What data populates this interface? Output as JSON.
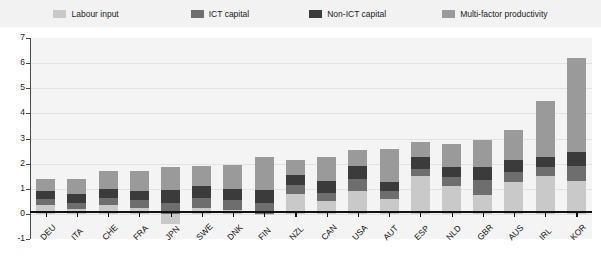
{
  "legend": {
    "items": [
      {
        "label": "Labour input",
        "color": "#c9c9c9",
        "name": "legend-labour-input"
      },
      {
        "label": "ICT capital",
        "color": "#6e6e6e",
        "name": "legend-ict-capital"
      },
      {
        "label": "Non-ICT capital",
        "color": "#3b3b3b",
        "name": "legend-non-ict-capital"
      },
      {
        "label": "Multi-factor productivity",
        "color": "#9a9a9a",
        "name": "legend-multi-factor-productivity"
      }
    ]
  },
  "axis": {
    "y_ticks": [
      "7",
      "6",
      "5",
      "4",
      "3",
      "2",
      "1",
      "0",
      "-1"
    ],
    "y_min": -1,
    "y_max": 7
  },
  "chart_data": {
    "type": "bar",
    "stacked": true,
    "title": "",
    "xlabel": "",
    "ylabel": "",
    "ylim": [
      -1,
      7
    ],
    "grid": true,
    "legend_position": "top",
    "categories": [
      "DEU",
      "ITA",
      "CHE",
      "FRA",
      "JPN",
      "SWE",
      "DNK",
      "FIN",
      "NZL",
      "CAN",
      "USA",
      "AUT",
      "ESP",
      "NLD",
      "GBR",
      "AUS",
      "IRL",
      "KOR"
    ],
    "series": [
      {
        "name": "Labour input",
        "color": "#c9c9c9",
        "values": [
          0.35,
          0.2,
          0.35,
          0.25,
          -0.4,
          0.25,
          0.15,
          -0.05,
          0.8,
          0.5,
          0.9,
          0.6,
          1.5,
          1.1,
          0.75,
          1.25,
          1.5,
          1.3
        ]
      },
      {
        "name": "ICT capital",
        "color": "#6e6e6e",
        "values": [
          0.25,
          0.25,
          0.3,
          0.3,
          0.45,
          0.4,
          0.4,
          0.45,
          0.35,
          0.35,
          0.5,
          0.3,
          0.3,
          0.35,
          0.6,
          0.4,
          0.35,
          0.6
        ]
      },
      {
        "name": "Non-ICT capital",
        "color": "#3b3b3b",
        "values": [
          0.3,
          0.35,
          0.35,
          0.35,
          0.5,
          0.45,
          0.45,
          0.5,
          0.4,
          0.45,
          0.5,
          0.35,
          0.45,
          0.4,
          0.5,
          0.5,
          0.4,
          0.55
        ]
      },
      {
        "name": "Multi-factor productivity",
        "color": "#9a9a9a",
        "values": [
          0.5,
          0.6,
          0.7,
          0.8,
          0.9,
          0.8,
          0.95,
          1.3,
          0.6,
          0.95,
          0.65,
          1.35,
          0.6,
          0.95,
          1.1,
          1.2,
          2.25,
          3.75
        ]
      }
    ],
    "totals": [
      1.4,
      1.4,
      1.7,
      1.7,
      1.45,
      1.9,
      1.95,
      2.2,
      2.15,
      2.25,
      2.55,
      2.6,
      2.85,
      2.8,
      2.95,
      3.35,
      4.5,
      6.2
    ]
  }
}
